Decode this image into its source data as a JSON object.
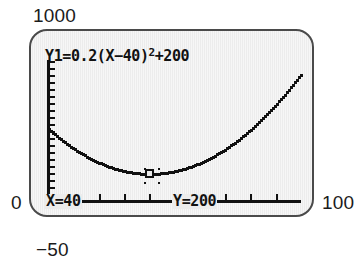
{
  "device": {
    "kind": "graphing-calculator-screen",
    "screen_bg": "#ececec",
    "ink": "#111111",
    "bezel": "#4a4a4a"
  },
  "window_labels": {
    "y_max": "1000",
    "y_min": "−50",
    "x_min": "0",
    "x_max": "100"
  },
  "screen": {
    "equation": {
      "prefix": "Y1=0.2(X−40)",
      "exponent": "2",
      "suffix": "+200"
    },
    "trace_x": "X=40",
    "trace_y": "Y=200"
  },
  "chart_data": {
    "type": "line",
    "xlabel": "",
    "ylabel": "",
    "xlim": [
      0,
      100
    ],
    "ylim": [
      -50,
      1000
    ],
    "grid": false,
    "legend": "none",
    "equation": "Y1 = 0.2(X-40)^2 + 200",
    "vertex": {
      "x": 40,
      "y": 200
    },
    "trace_point": {
      "x": 40,
      "y": 200,
      "label_x": "X=40",
      "label_y": "Y=200"
    },
    "x_axis_ticks_value_step": 10,
    "y_axis_ticks_value_step": 100,
    "x": [
      0,
      5,
      10,
      15,
      20,
      25,
      30,
      35,
      40,
      45,
      50,
      55,
      60,
      65,
      70,
      75,
      80,
      85,
      90,
      95,
      100
    ],
    "y": [
      520,
      445,
      380,
      325,
      280,
      245,
      220,
      205,
      200,
      205,
      220,
      245,
      280,
      325,
      380,
      445,
      520,
      605,
      700,
      805,
      920
    ],
    "annotations": [
      {
        "text": "X=40",
        "at": "bottom-left, on x-axis row"
      },
      {
        "text": "Y=200",
        "at": "bottom-center, on x-axis row"
      },
      {
        "text": "Y1=0.2(X−40)²+200",
        "at": "top-left of screen"
      }
    ]
  }
}
